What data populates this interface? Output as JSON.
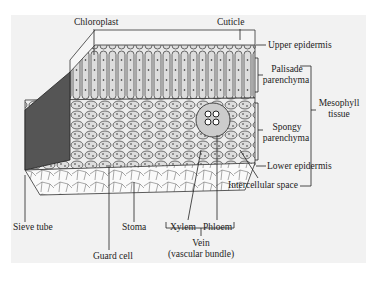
{
  "diagram": {
    "labels": {
      "chloroplast": "Chloroplast",
      "cuticle": "Cuticle",
      "upper_epidermis": "Upper epidermis",
      "palisade_1": "Palisade",
      "palisade_2": "parenchyma",
      "mesophyll_1": "Mesophyll",
      "mesophyll_2": "tissue",
      "spongy_1": "Spongy",
      "spongy_2": "parenchyma",
      "lower_epidermis": "Lower epidermis",
      "intercellular_space": "Intercellular space",
      "sieve_tube": "Sieve tube",
      "stoma": "Stoma",
      "xylem": "Xylem",
      "phloem": "Phloem",
      "guard_cell": "Guard cell",
      "vein_1": "Vein",
      "vein_2": "(vascular bundle)"
    },
    "colors": {
      "panel": "#f2f2f2",
      "ink": "#222222"
    }
  }
}
